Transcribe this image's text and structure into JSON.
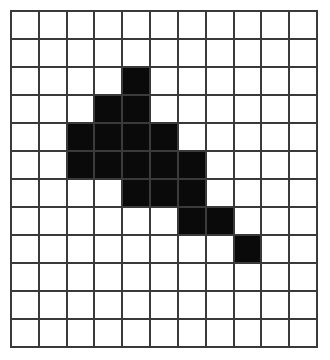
{
  "grid": {
    "rows": 12,
    "cols": 11,
    "fill_color": "#0a0a0a",
    "empty_color": "#ffffff",
    "line_color": "#3a3a3a",
    "filled_cells": [
      [
        2,
        4
      ],
      [
        3,
        3
      ],
      [
        3,
        4
      ],
      [
        4,
        2
      ],
      [
        4,
        3
      ],
      [
        4,
        4
      ],
      [
        4,
        5
      ],
      [
        5,
        2
      ],
      [
        5,
        3
      ],
      [
        5,
        4
      ],
      [
        5,
        5
      ],
      [
        5,
        6
      ],
      [
        6,
        4
      ],
      [
        6,
        5
      ],
      [
        6,
        6
      ],
      [
        7,
        6
      ],
      [
        7,
        7
      ],
      [
        8,
        8
      ]
    ]
  }
}
